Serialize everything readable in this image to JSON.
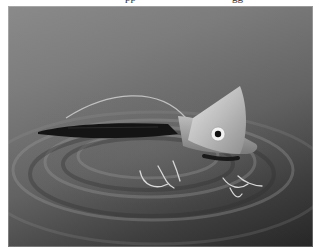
{
  "figure": {
    "top_clipped_text": {
      "left": "pp",
      "right": "gg"
    },
    "photo": {
      "subject": "fishing lure floating on rippled water",
      "style": "grayscale photograph",
      "elements": [
        "lure-head",
        "lure-eye",
        "lure-lip",
        "lure-body",
        "line-wire",
        "treble-hooks",
        "water-ripples"
      ]
    }
  }
}
